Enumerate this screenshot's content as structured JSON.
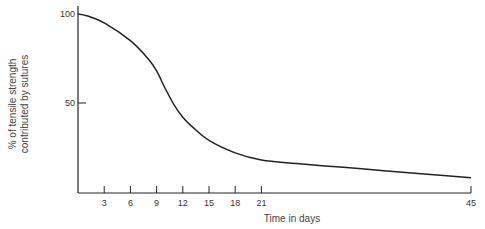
{
  "chart_data": {
    "type": "line",
    "title": "",
    "xlabel": "Time in days",
    "ylabel": [
      "% of tensile strength",
      "contributed by sutures"
    ],
    "x_ticks": [
      3,
      6,
      9,
      12,
      15,
      18,
      21,
      45
    ],
    "y_ticks": [
      100,
      50
    ],
    "xlim": [
      0,
      45
    ],
    "ylim": [
      0,
      100
    ],
    "grid": false,
    "legend": null,
    "series": [
      {
        "name": "Suture tensile strength contribution",
        "x": [
          0,
          1,
          3,
          6,
          8,
          9,
          10,
          11,
          12,
          13,
          15,
          18,
          21,
          25,
          30,
          35,
          40,
          45
        ],
        "y": [
          100,
          99,
          95,
          85,
          75,
          68,
          58,
          49,
          42,
          37,
          29,
          22,
          18,
          16,
          14,
          12,
          10,
          8
        ]
      }
    ]
  }
}
